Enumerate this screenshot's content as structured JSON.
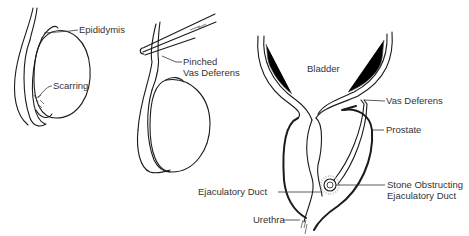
{
  "figures": [
    {
      "id": "testis-scarring",
      "labels": [
        {
          "key": "epididymis",
          "text": "Epididymis"
        },
        {
          "key": "scarring",
          "text": "Scarring"
        }
      ]
    },
    {
      "id": "testis-pinched",
      "labels": [
        {
          "key": "pinched_vas",
          "line1": "Pinched",
          "line2": "Vas Deferens"
        }
      ]
    },
    {
      "id": "bladder-prostate",
      "labels": [
        {
          "key": "bladder",
          "text": "Bladder"
        },
        {
          "key": "vas_deferens",
          "text": "Vas Deferens"
        },
        {
          "key": "prostate",
          "text": "Prostate"
        },
        {
          "key": "ejaculatory_duct",
          "text": "Ejaculatory Duct"
        },
        {
          "key": "stone",
          "line1": "Stone Obstructing",
          "line2": "Ejaculatory Duct"
        },
        {
          "key": "urethra",
          "text": "Urethra"
        }
      ]
    }
  ],
  "colors": {
    "line": "#1a1a1a",
    "label": "#333333",
    "background": "#ffffff"
  }
}
